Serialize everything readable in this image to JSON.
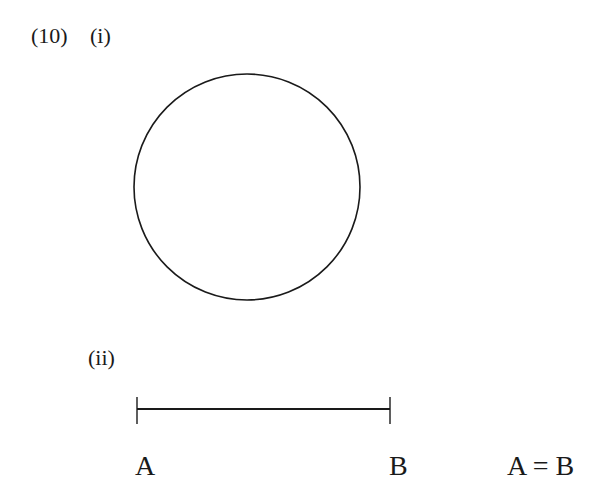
{
  "question": {
    "number": "(10)",
    "parts": [
      {
        "label": "(i)",
        "figure": {
          "type": "circle",
          "center": [
            247,
            187
          ],
          "radius": 113
        }
      },
      {
        "label": "(ii)",
        "figure": {
          "type": "line-segment",
          "x1": 137,
          "x2": 390,
          "y": 409,
          "tick_top": 397,
          "tick_bottom": 424
        },
        "endpoint_labels": [
          "A",
          "B"
        ],
        "equation": "A = B"
      }
    ]
  },
  "colors": {
    "stroke": "#1a1a1a",
    "background": "#ffffff"
  }
}
